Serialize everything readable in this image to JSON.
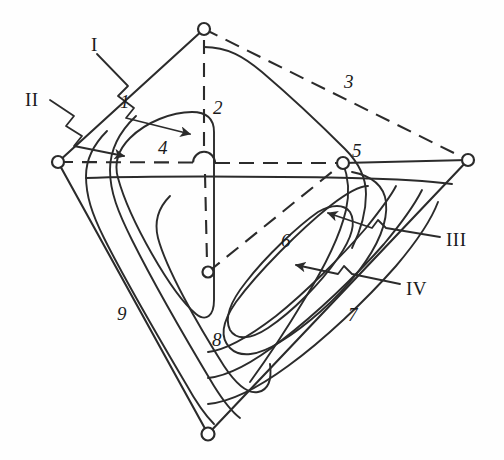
{
  "diagram": {
    "stroke_color": "#2b2b2b",
    "background_color": "#fefefe",
    "node_fill": "#ffffff",
    "numeric_labels": [
      {
        "id": "1",
        "text": "1",
        "x": 120,
        "y": 92
      },
      {
        "id": "2",
        "text": "2",
        "x": 213,
        "y": 98
      },
      {
        "id": "3",
        "text": "3",
        "x": 344,
        "y": 72
      },
      {
        "id": "4",
        "text": "4",
        "x": 158,
        "y": 138
      },
      {
        "id": "5",
        "text": "5",
        "x": 352,
        "y": 141
      },
      {
        "id": "6",
        "text": "6",
        "x": 281,
        "y": 231
      },
      {
        "id": "7",
        "text": "7",
        "x": 348,
        "y": 305
      },
      {
        "id": "8",
        "text": "8",
        "x": 212,
        "y": 330
      },
      {
        "id": "9",
        "text": "9",
        "x": 117,
        "y": 304
      }
    ],
    "roman_labels": [
      {
        "id": "I",
        "text": "I",
        "x": 91,
        "y": 35
      },
      {
        "id": "II",
        "text": "II",
        "x": 25,
        "y": 90
      },
      {
        "id": "III",
        "text": "III",
        "x": 446,
        "y": 230
      },
      {
        "id": "IV",
        "text": "IV",
        "x": 406,
        "y": 279
      }
    ],
    "nodes": [
      {
        "id": "node-top",
        "x": 204,
        "y": 29,
        "r": 6
      },
      {
        "id": "node-left",
        "x": 58,
        "y": 162,
        "r": 6
      },
      {
        "id": "node-right",
        "x": 468,
        "y": 160,
        "r": 6
      },
      {
        "id": "node-center",
        "x": 208,
        "y": 272,
        "r": 5
      },
      {
        "id": "node-5",
        "x": 343,
        "y": 163,
        "r": 6
      },
      {
        "id": "node-bottom",
        "x": 208,
        "y": 434,
        "r": 6
      }
    ],
    "solid_outline": [
      "M204,29 L58,162",
      "M58,162 L208,434",
      "M208,434 L468,160",
      "M468,160 L343,163"
    ],
    "dashed_lines": [
      "M204,29 L468,160",
      "M58,162 L343,163",
      "M204,29 L204,434",
      "M208,272 L343,163"
    ],
    "crossover_hop": {
      "x": 204,
      "y": 163,
      "r": 11
    },
    "leaders": [
      {
        "id": "leader-I",
        "from": [
          97,
          52
        ],
        "to": [
          190,
          132
        ],
        "zigzag": true
      },
      {
        "id": "leader-II",
        "from": [
          48,
          100
        ],
        "to": [
          126,
          154
        ],
        "zigzag": true
      },
      {
        "id": "leader-III",
        "from": [
          440,
          236
        ],
        "to": [
          330,
          212
        ],
        "zigzag": true
      },
      {
        "id": "leader-IV",
        "from": [
          400,
          283
        ],
        "to": [
          298,
          266
        ],
        "zigzag": true
      }
    ]
  }
}
